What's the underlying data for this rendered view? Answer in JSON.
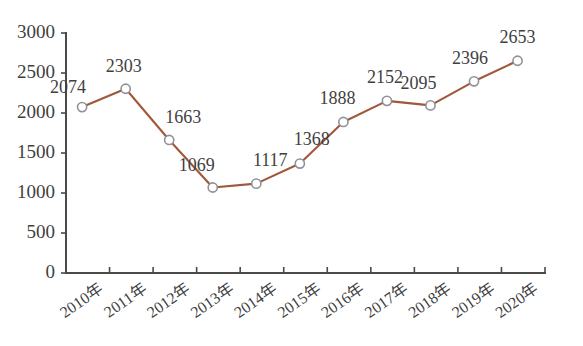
{
  "chart_data": {
    "type": "line",
    "title": "",
    "subtitle": "",
    "xlabel": "",
    "ylabel": "",
    "categories": [
      "2010年",
      "2011年",
      "2012年",
      "2013年",
      "2014年",
      "2015年",
      "2016年",
      "2017年",
      "2018年",
      "2019年",
      "2020年"
    ],
    "values": [
      2074,
      2303,
      1663,
      1069,
      1117,
      1368,
      1888,
      2152,
      2095,
      2396,
      2653
    ],
    "data_labels": [
      "2074",
      "2303",
      "1663",
      "1069",
      "1117",
      "1368",
      "1888",
      "2152",
      "2095",
      "2396",
      "2653"
    ],
    "ylim": [
      0,
      3000
    ],
    "ytick_labels": [
      "0",
      "500",
      "1000",
      "1500",
      "2000",
      "2500",
      "3000"
    ],
    "ytick_values": [
      0,
      500,
      1000,
      1500,
      2000,
      2500,
      3000
    ],
    "grid": false,
    "legend": false,
    "legend_position": "none",
    "series": [
      {
        "name": "",
        "values": [
          2074,
          2303,
          1663,
          1069,
          1117,
          1368,
          1888,
          2152,
          2095,
          2396,
          2653
        ],
        "line_color": "#a0583a",
        "marker": "circle-hollow",
        "marker_fill": "#ffffff",
        "marker_stroke": "#8f9296"
      }
    ],
    "axis_color": "#4a4a48",
    "text_color": "#3f3f3f",
    "background": "#ffffff",
    "xtick_rotation": -35
  }
}
